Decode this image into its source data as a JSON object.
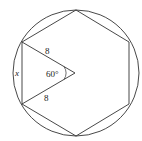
{
  "diagram": {
    "type": "geometry",
    "labels": {
      "radius_top": "8",
      "radius_bottom": "8",
      "angle": "60°",
      "side": "x"
    },
    "colors": {
      "stroke": "#333333",
      "background": "#ffffff"
    }
  }
}
